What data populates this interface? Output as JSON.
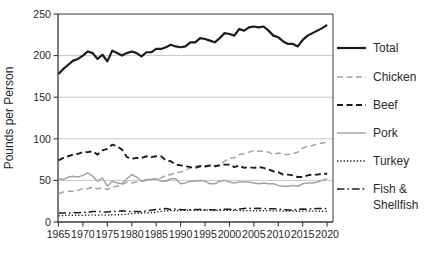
{
  "chart_data": {
    "type": "line",
    "title": "",
    "xlabel": "",
    "ylabel": "Pounds per Person",
    "ylim": [
      0,
      250
    ],
    "xlim": [
      1964.9,
      2021.2
    ],
    "grid": "horizontal-only",
    "legend_position": "right",
    "x_ticks": [
      1965,
      1970,
      1975,
      1980,
      1985,
      1990,
      1995,
      2000,
      2005,
      2010,
      2015,
      2020
    ],
    "y_ticks": [
      0,
      50,
      100,
      150,
      200,
      250
    ],
    "x": [
      1965,
      1966,
      1967,
      1968,
      1969,
      1970,
      1971,
      1972,
      1973,
      1974,
      1975,
      1976,
      1977,
      1978,
      1979,
      1980,
      1981,
      1982,
      1983,
      1984,
      1985,
      1986,
      1987,
      1988,
      1989,
      1990,
      1991,
      1992,
      1993,
      1994,
      1995,
      1996,
      1997,
      1998,
      1999,
      2000,
      2001,
      2002,
      2003,
      2004,
      2005,
      2006,
      2007,
      2008,
      2009,
      2010,
      2011,
      2012,
      2013,
      2014,
      2015,
      2016,
      2017,
      2018,
      2019,
      2020
    ],
    "series": [
      {
        "name": "Total",
        "color": "#1c1c1c",
        "dash": "solid",
        "width": 2.2,
        "legend_lines": [
          "Total"
        ],
        "values": [
          178,
          184,
          189,
          194,
          196,
          200,
          205,
          203,
          196,
          201,
          193,
          206,
          203,
          200,
          203,
          205,
          203,
          199,
          204,
          204,
          208,
          208,
          210,
          213,
          211,
          210,
          211,
          216,
          216,
          221,
          220,
          218,
          216,
          221,
          227,
          226,
          224,
          232,
          230,
          234,
          235,
          234,
          235,
          230,
          224,
          222,
          217,
          214,
          214,
          211,
          219,
          224,
          227,
          230,
          233,
          237
        ]
      },
      {
        "name": "Chicken",
        "color": "#a3a3a3",
        "dash": "dash",
        "width": 1.5,
        "legend_lines": [
          "Chicken"
        ],
        "values": [
          34,
          36,
          37,
          37,
          38,
          40,
          40,
          42,
          40,
          41,
          39,
          42,
          43,
          45,
          48,
          47,
          48,
          49,
          50,
          51,
          52,
          53,
          56,
          57,
          59,
          60,
          62,
          65,
          67,
          68,
          66,
          67,
          68,
          68,
          73,
          77,
          77,
          81,
          82,
          84,
          86,
          85,
          85,
          84,
          81,
          83,
          81,
          81,
          82,
          84,
          89,
          91,
          92,
          94,
          95,
          96
        ]
      },
      {
        "name": "Beef",
        "color": "#1c1c1c",
        "dash": "dash",
        "width": 1.9,
        "legend_lines": [
          "Beef"
        ],
        "values": [
          74,
          77,
          79,
          81,
          82,
          84,
          84,
          85,
          81,
          86,
          88,
          93,
          91,
          87,
          78,
          76,
          77,
          77,
          79,
          78,
          79,
          79,
          74,
          73,
          69,
          68,
          67,
          66,
          65,
          67,
          67,
          68,
          67,
          68,
          69,
          69,
          66,
          68,
          65,
          66,
          65,
          66,
          65,
          63,
          61,
          60,
          57,
          57,
          56,
          54,
          54,
          56,
          57,
          57,
          58,
          58
        ]
      },
      {
        "name": "Pork",
        "color": "#a3a3a3",
        "dash": "solid",
        "width": 1.5,
        "legend_lines": [
          "Pork"
        ],
        "values": [
          52,
          51,
          54,
          55,
          54,
          56,
          59,
          55,
          49,
          53,
          43,
          49,
          47,
          46,
          52,
          57,
          54,
          49,
          51,
          51,
          52,
          49,
          49,
          52,
          52,
          46,
          47,
          49,
          49,
          50,
          49,
          46,
          46,
          49,
          50,
          48,
          47,
          48,
          48,
          48,
          47,
          46,
          47,
          46,
          46,
          44,
          43,
          43,
          44,
          43,
          46,
          47,
          47,
          48,
          50,
          52
        ]
      },
      {
        "name": "Turkey",
        "color": "#1c1c1c",
        "dash": "dot",
        "width": 1.3,
        "legend_lines": [
          "Turkey"
        ],
        "values": [
          7.4,
          7.7,
          8.1,
          7.9,
          8.1,
          8.0,
          8.3,
          8.5,
          8.3,
          8.5,
          8.3,
          8.8,
          8.6,
          8.9,
          9.4,
          10.3,
          10.7,
          10.8,
          11.0,
          11.2,
          11.6,
          12.7,
          13.5,
          13.7,
          13.8,
          13.8,
          14.1,
          14.1,
          14.0,
          14.1,
          14.1,
          14.6,
          13.9,
          14.2,
          14.1,
          13.9,
          13.8,
          14.0,
          13.8,
          13.7,
          13.4,
          13.5,
          13.7,
          13.8,
          13.3,
          13.3,
          13.1,
          13.2,
          13.2,
          12.9,
          13.0,
          13.3,
          13.1,
          13.0,
          12.9,
          12.8
        ]
      },
      {
        "name": "Fish & Shellfish",
        "color": "#1c1c1c",
        "dash": "dashdot",
        "width": 1.5,
        "legend_lines": [
          "Fish &",
          "Shellfish"
        ],
        "values": [
          10.8,
          10.9,
          10.6,
          11.0,
          11.2,
          11.7,
          11.5,
          12.5,
          12.7,
          12.1,
          12.1,
          12.9,
          12.6,
          13.4,
          13.0,
          12.4,
          12.6,
          12.4,
          13.3,
          14.1,
          15.0,
          15.4,
          16.1,
          15.1,
          15.6,
          14.9,
          14.8,
          14.7,
          14.9,
          15.1,
          14.8,
          14.7,
          14.5,
          14.8,
          15.4,
          15.2,
          14.7,
          15.6,
          16.3,
          16.5,
          16.1,
          16.5,
          16.2,
          15.8,
          15.8,
          15.6,
          14.9,
          14.3,
          14.5,
          15.2,
          15.5,
          15.4,
          16.0,
          16.1,
          16.2,
          16.0
        ]
      }
    ],
    "colors": {
      "grid": "#c9c9c9",
      "axis": "#3a3a3a",
      "dark_series": "#1c1c1c",
      "gray_series": "#a3a3a3"
    }
  }
}
